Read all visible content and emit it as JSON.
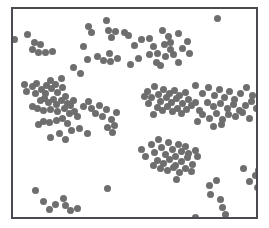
{
  "figure": {
    "kind": "scatter-plot-panel",
    "background_color": "#ffffff",
    "frame": {
      "x": 11,
      "y": 7,
      "width": 247,
      "height": 212,
      "border_color": "#4a4a50",
      "border_width": 2,
      "fill_color": "#ffffff"
    },
    "title": "",
    "xlabel": "",
    "ylabel": ""
  },
  "chart_data": {
    "type": "scatter",
    "title": "",
    "xlabel": "",
    "ylabel": "",
    "xlim": [
      0,
      247
    ],
    "ylim": [
      0,
      212
    ],
    "grid": false,
    "legend": null,
    "marker": {
      "shape": "circle",
      "color": "#6e6e6e",
      "size_px": 7,
      "edge_color": "#6e6e6e",
      "opacity": 1
    },
    "point_count": 196,
    "series": [
      {
        "name": "points",
        "color": "#6e6e6e",
        "points": [
          [
            2,
            31
          ],
          [
            15,
            26
          ],
          [
            20,
            41
          ],
          [
            22,
            34
          ],
          [
            26,
            44
          ],
          [
            28,
            36
          ],
          [
            33,
            44
          ],
          [
            40,
            43
          ],
          [
            77,
            18
          ],
          [
            80,
            24
          ],
          [
            95,
            12
          ],
          [
            97,
            22
          ],
          [
            100,
            29
          ],
          [
            104,
            23
          ],
          [
            113,
            24
          ],
          [
            72,
            38
          ],
          [
            76,
            51
          ],
          [
            86,
            48
          ],
          [
            92,
            52
          ],
          [
            98,
            45
          ],
          [
            99,
            53
          ],
          [
            106,
            50
          ],
          [
            62,
            60
          ],
          [
            69,
            66
          ],
          [
            49,
            71
          ],
          [
            117,
            27
          ],
          [
            131,
            31
          ],
          [
            124,
            37
          ],
          [
            139,
            30
          ],
          [
            143,
            38
          ],
          [
            152,
            22
          ],
          [
            154,
            36
          ],
          [
            158,
            28
          ],
          [
            160,
            34
          ],
          [
            160,
            41
          ],
          [
            147,
            45
          ],
          [
            155,
            48
          ],
          [
            163,
            46
          ],
          [
            172,
            40
          ],
          [
            177,
            33
          ],
          [
            168,
            25
          ],
          [
            179,
            45
          ],
          [
            139,
            46
          ],
          [
            128,
            50
          ],
          [
            119,
            57
          ],
          [
            146,
            55
          ],
          [
            150,
            58
          ],
          [
            168,
            55
          ],
          [
            208,
            10
          ],
          [
            12,
            77
          ],
          [
            14,
            84
          ],
          [
            20,
            79
          ],
          [
            24,
            76
          ],
          [
            23,
            86
          ],
          [
            29,
            82
          ],
          [
            34,
            78
          ],
          [
            33,
            86
          ],
          [
            38,
            73
          ],
          [
            39,
            81
          ],
          [
            43,
            77
          ],
          [
            45,
            85
          ],
          [
            50,
            80
          ],
          [
            28,
            93
          ],
          [
            32,
            91
          ],
          [
            36,
            95
          ],
          [
            41,
            92
          ],
          [
            44,
            97
          ],
          [
            49,
            93
          ],
          [
            53,
            89
          ],
          [
            55,
            96
          ],
          [
            20,
            99
          ],
          [
            25,
            101
          ],
          [
            31,
            103
          ],
          [
            38,
            102
          ],
          [
            45,
            104
          ],
          [
            52,
            101
          ],
          [
            58,
            98
          ],
          [
            62,
            93
          ],
          [
            57,
            107
          ],
          [
            63,
            104
          ],
          [
            66,
            110
          ],
          [
            50,
            112
          ],
          [
            44,
            114
          ],
          [
            37,
            116
          ],
          [
            31,
            115
          ],
          [
            26,
            118
          ],
          [
            55,
            117
          ],
          [
            72,
            99
          ],
          [
            77,
            94
          ],
          [
            80,
            101
          ],
          [
            84,
            106
          ],
          [
            88,
            98
          ],
          [
            91,
            110
          ],
          [
            95,
            102
          ],
          [
            100,
            113
          ],
          [
            105,
            105
          ],
          [
            96,
            121
          ],
          [
            68,
            122
          ],
          [
            59,
            124
          ],
          [
            47,
            127
          ],
          [
            38,
            131
          ],
          [
            53,
            133
          ],
          [
            76,
            127
          ],
          [
            101,
            126
          ],
          [
            103,
            119
          ],
          [
            137,
            84
          ],
          [
            141,
            90
          ],
          [
            144,
            79
          ],
          [
            148,
            87
          ],
          [
            150,
            94
          ],
          [
            153,
            82
          ],
          [
            156,
            90
          ],
          [
            159,
            86
          ],
          [
            161,
            95
          ],
          [
            164,
            83
          ],
          [
            166,
            91
          ],
          [
            169,
            88
          ],
          [
            172,
            96
          ],
          [
            175,
            85
          ],
          [
            178,
            92
          ],
          [
            147,
            100
          ],
          [
            152,
            103
          ],
          [
            157,
            99
          ],
          [
            162,
            104
          ],
          [
            167,
            101
          ],
          [
            171,
            107
          ],
          [
            176,
            102
          ],
          [
            181,
            98
          ],
          [
            143,
            108
          ],
          [
            186,
            95
          ],
          [
            190,
            103
          ],
          [
            138,
            96
          ],
          [
            134,
            89
          ],
          [
            186,
            78
          ],
          [
            193,
            86
          ],
          [
            199,
            80
          ],
          [
            205,
            88
          ],
          [
            210,
            82
          ],
          [
            215,
            90
          ],
          [
            220,
            84
          ],
          [
            225,
            92
          ],
          [
            231,
            86
          ],
          [
            237,
            80
          ],
          [
            243,
            88
          ],
          [
            198,
            95
          ],
          [
            204,
            99
          ],
          [
            211,
            96
          ],
          [
            218,
            101
          ],
          [
            224,
            97
          ],
          [
            230,
            103
          ],
          [
            236,
            98
          ],
          [
            242,
            94
          ],
          [
            248,
            101
          ],
          [
            193,
            108
          ],
          [
            200,
            112
          ],
          [
            207,
            106
          ],
          [
            213,
            113
          ],
          [
            219,
            108
          ],
          [
            226,
            110
          ],
          [
            233,
            105
          ],
          [
            240,
            112
          ],
          [
            188,
            115
          ],
          [
            204,
            120
          ],
          [
            212,
            118
          ],
          [
            141,
            138
          ],
          [
            144,
            146
          ],
          [
            148,
            133
          ],
          [
            151,
            141
          ],
          [
            155,
            148
          ],
          [
            158,
            136
          ],
          [
            162,
            143
          ],
          [
            165,
            150
          ],
          [
            168,
            138
          ],
          [
            171,
            145
          ],
          [
            175,
            140
          ],
          [
            178,
            147
          ],
          [
            147,
            154
          ],
          [
            153,
            157
          ],
          [
            159,
            153
          ],
          [
            165,
            159
          ],
          [
            171,
            155
          ],
          [
            177,
            151
          ],
          [
            182,
            158
          ],
          [
            185,
            144
          ],
          [
            143,
            160
          ],
          [
            150,
            163
          ],
          [
            157,
            165
          ],
          [
            163,
            162
          ],
          [
            169,
            167
          ],
          [
            175,
            163
          ],
          [
            181,
            166
          ],
          [
            188,
            150
          ],
          [
            135,
            150
          ],
          [
            131,
            143
          ],
          [
            166,
            174
          ],
          [
            23,
            185
          ],
          [
            31,
            196
          ],
          [
            37,
            204
          ],
          [
            43,
            199
          ],
          [
            51,
            193
          ],
          [
            53,
            200
          ],
          [
            58,
            205
          ],
          [
            66,
            203
          ],
          [
            96,
            183
          ],
          [
            200,
            180
          ],
          [
            201,
            189
          ],
          [
            207,
            175
          ],
          [
            211,
            194
          ],
          [
            213,
            202
          ],
          [
            216,
            209
          ],
          [
            186,
            212
          ],
          [
            234,
            163
          ],
          [
            240,
            176
          ],
          [
            246,
            170
          ],
          [
            249,
            182
          ],
          [
            253,
            157
          ],
          [
            250,
            165
          ]
        ]
      }
    ]
  }
}
